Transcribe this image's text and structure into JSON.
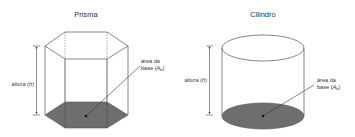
{
  "figures": [
    {
      "id": "prism",
      "title": "Prisma",
      "height_label": "altura (h)",
      "height_label_parts": {
        "text": "altura (",
        "var": "h",
        "close": ")"
      },
      "base_label_line1": "área da",
      "base_label_line2": {
        "text": "base (",
        "var": "A",
        "sub": "b",
        "close": ")"
      }
    },
    {
      "id": "cylinder",
      "title": "Cilindro",
      "height_label": "altura (h)",
      "height_label_parts": {
        "text": "altura (",
        "var": "h",
        "close": ")"
      },
      "base_label_line1": "área da",
      "base_label_line2": {
        "text": "base (",
        "var": "A",
        "sub": "b",
        "close": ")"
      }
    }
  ],
  "colors": {
    "base_fill": "#6e6e6e",
    "edges": "#555555",
    "text": "#333333",
    "background": "#ffffff"
  }
}
